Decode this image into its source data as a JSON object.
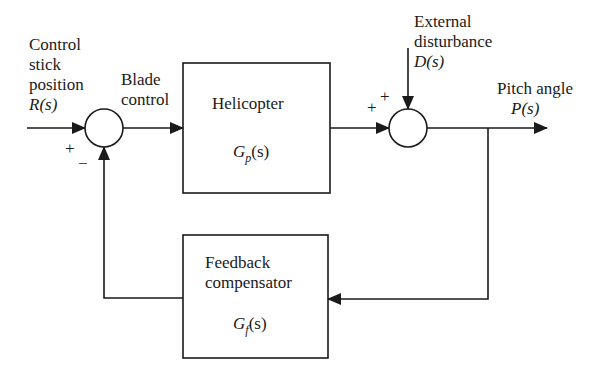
{
  "diagram": {
    "type": "block-diagram",
    "input": {
      "label_lines": [
        "Control",
        "stick",
        "position"
      ],
      "signal": "R(s)"
    },
    "blade_control": {
      "label_lines": [
        "Blade",
        "control"
      ]
    },
    "plant": {
      "name": "Helicopter",
      "transfer_fn": {
        "base": "G",
        "sub": "p",
        "arg": "(s)"
      }
    },
    "feedback": {
      "name_lines": [
        "Feedback",
        "compensator"
      ],
      "transfer_fn": {
        "base": "G",
        "sub": "f",
        "arg": "(s)"
      }
    },
    "disturbance": {
      "label_lines": [
        "External",
        "disturbance"
      ],
      "signal": "D(s)"
    },
    "output": {
      "label": "Pitch angle",
      "signal": "P(s)"
    },
    "summing_junction_1": {
      "signs": [
        "+",
        "−"
      ]
    },
    "summing_junction_2": {
      "signs": [
        "+",
        "+"
      ]
    },
    "colors": {
      "line": "#1a1a1a",
      "background": "#ffffff"
    }
  }
}
